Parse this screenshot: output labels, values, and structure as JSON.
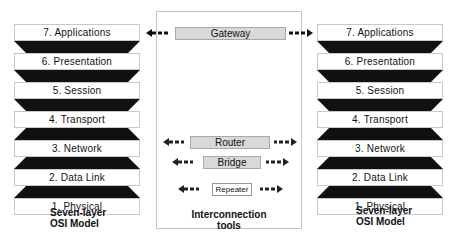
{
  "left_stack": {
    "layers": [
      {
        "label": "7.  Applications"
      },
      {
        "label": "6.  Presentation"
      },
      {
        "label": "5.  Session"
      },
      {
        "label": "4.  Transport"
      },
      {
        "label": "3.  Network"
      },
      {
        "label": "2.  Data Link"
      },
      {
        "label": "1.  Physical"
      }
    ],
    "caption_line1": "Seven-layer",
    "caption_line2": "OSI Model"
  },
  "right_stack": {
    "layers": [
      {
        "label": "7.  Applications"
      },
      {
        "label": "6.  Presentation"
      },
      {
        "label": "5.  Session"
      },
      {
        "label": "4.  Transport"
      },
      {
        "label": "3.  Network"
      },
      {
        "label": "2.  Data Link"
      },
      {
        "label": "1.  Physical"
      }
    ],
    "caption_line1": "Seven-layer",
    "caption_line2": "OSI Model"
  },
  "tools": {
    "gateway": "Gateway",
    "router": "Router",
    "bridge": "Bridge",
    "repeater": "Repeater",
    "caption_line1": "Interconnection",
    "caption_line2": "tools"
  },
  "colors": {
    "connector_fill": "#111111",
    "tool_fill": "#d9d9d9",
    "border": "#c4c4c4"
  }
}
